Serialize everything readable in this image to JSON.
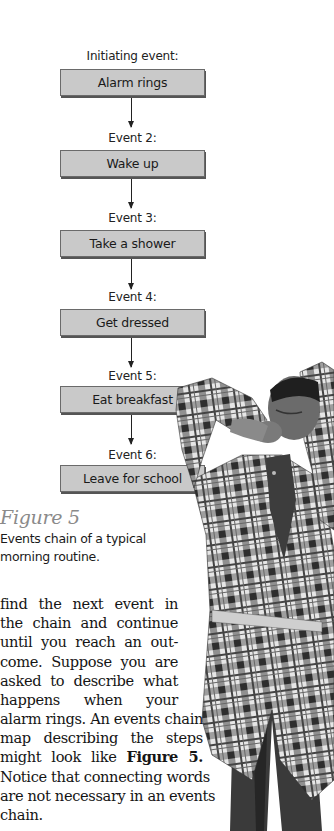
{
  "figure": {
    "events": [
      {
        "label": "Initiating event:",
        "text": "Alarm rings"
      },
      {
        "label": "Event 2:",
        "text": "Wake up"
      },
      {
        "label": "Event 3:",
        "text": "Take a shower"
      },
      {
        "label": "Event 4:",
        "text": "Get dressed"
      },
      {
        "label": "Event 5:",
        "text": "Eat breakfast"
      },
      {
        "label": "Event 6:",
        "text": "Leave for school"
      }
    ],
    "title": "Figure 5",
    "caption_lines": [
      "Events chain of a typical",
      "morning routine."
    ],
    "photo": {
      "description": "boy in plaid robe yawning and stretching",
      "icon": "photo-yawning-boy"
    }
  },
  "body": {
    "lines": [
      "find the next event in",
      "the chain and continue",
      "until you reach an out-",
      "come. Suppose you are",
      "asked to describe what",
      "happens when your",
      "alarm rings. An events chain",
      "map describing the steps",
      "might look like",
      "Notice that connecting words",
      "are not necessary in an events",
      "chain."
    ],
    "bold_ref": "Figure 5."
  },
  "colors": {
    "box_fill": "#c9c9c9",
    "box_border": "#6a6a6a",
    "figure_title": "#8a8a8a",
    "text": "#151515"
  }
}
